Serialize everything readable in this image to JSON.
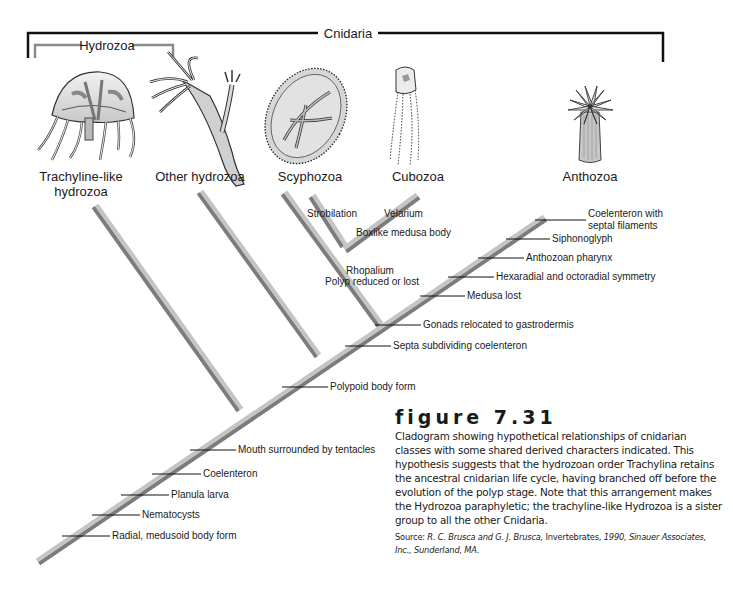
{
  "groups": {
    "cnidaria": "Cnidaria",
    "hydrozoa": "Hydrozoa"
  },
  "taxa": [
    {
      "name_line1": "Trachyline-like",
      "name_line2": "hydrozoa",
      "icon": "trachyline-medusa-icon"
    },
    {
      "name_line1": "Other hydrozoa",
      "name_line2": "",
      "icon": "hydroid-polyp-icon"
    },
    {
      "name_line1": "Scyphozoa",
      "name_line2": "",
      "icon": "scyphozoan-jellyfish-icon"
    },
    {
      "name_line1": "Cubozoa",
      "name_line2": "",
      "icon": "box-jellyfish-icon"
    },
    {
      "name_line1": "Anthozoa",
      "name_line2": "",
      "icon": "sea-anemone-icon"
    }
  ],
  "characters": {
    "trunk": [
      "Radial, medusoid body form",
      "Nematocysts",
      "Planula larva",
      "Coelenteron",
      "Mouth surrounded by tentacles",
      "Polypoid body form",
      "Septa subdividing coelenteron",
      "Gonads relocated to gastrodermis",
      "Medusa lost",
      "Hexaradial and octoradial symmetry",
      "Anthozoan pharynx",
      "Siphonoglyph",
      "Coelenteron with",
      "septal filaments"
    ],
    "scypho_cubo_node": [
      "Rhopalium",
      "Polyp reduced or lost"
    ],
    "scyphozoa": "Strobilation",
    "cubozoa": [
      "Velarium",
      "Boxlike medusa body"
    ]
  },
  "figure": {
    "title": "figure 7.31",
    "caption": "Cladogram showing hypothetical relationships of cnidarian classes with some shared derived characters indicated. This hypothesis suggests that the hydrozoan order Trachylina retains the ancestral cnidarian life cycle, having branched off before the evolution of the polyp stage. Note that this arrangement makes the Hydrozoa paraphyletic; the trachyline-like Hydrozoa is a sister group to all the other Cnidaria.",
    "source_prefix": "Source: ",
    "source_authors": "R. C. Brusca and G. J. Brusca,",
    "source_book": " Invertebrates, ",
    "source_details": "1990, Sinauer Associates, Inc., Sunderland, MA."
  },
  "colors": {
    "branch_light": "#c4c4c4",
    "branch_dark": "#7c7c7c",
    "bracket_cnidaria": "#111111",
    "bracket_hydrozoa": "#8a8a8a"
  }
}
